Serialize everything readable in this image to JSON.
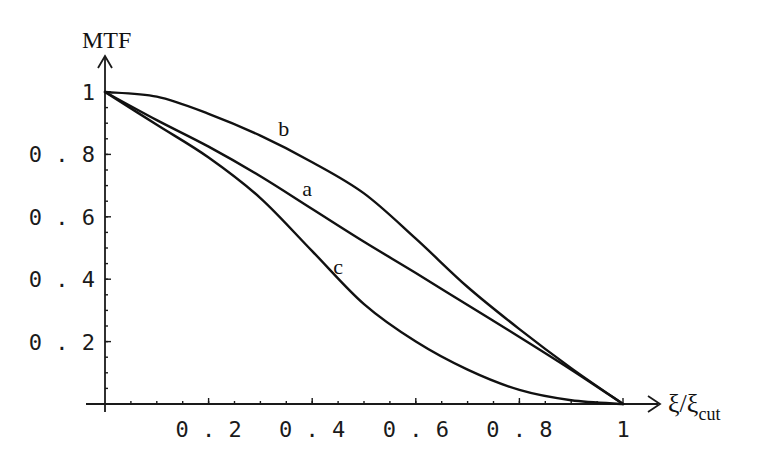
{
  "chart_data": {
    "type": "line",
    "title": "",
    "xlabel": "ξ/ξcut",
    "xlabel_main": "ξ/ξ",
    "xlabel_sub": "cut",
    "ylabel": "MTF",
    "xlim": [
      0,
      1
    ],
    "ylim": [
      0,
      1
    ],
    "grid": false,
    "legend": "inline curve labels",
    "x_ticks": [
      0.2,
      0.4,
      0.6,
      0.8,
      1
    ],
    "x_tick_labels": [
      "0.2",
      "0.4",
      "0.6",
      "0.8",
      "1"
    ],
    "y_ticks": [
      0.2,
      0.4,
      0.6,
      0.8,
      1
    ],
    "y_tick_labels": [
      "0.2",
      "0.4",
      "0.6",
      "0.8",
      "1"
    ],
    "x": [
      0,
      0.1,
      0.2,
      0.3,
      0.4,
      0.5,
      0.6,
      0.7,
      0.8,
      0.9,
      1.0
    ],
    "series": [
      {
        "name": "a",
        "values": [
          1.0,
          0.91,
          0.825,
          0.73,
          0.625,
          0.52,
          0.42,
          0.317,
          0.215,
          0.11,
          0.0
        ],
        "label_pos": [
          0.39,
          0.69
        ]
      },
      {
        "name": "b",
        "values": [
          1.0,
          0.985,
          0.93,
          0.86,
          0.775,
          0.675,
          0.53,
          0.375,
          0.24,
          0.115,
          0.0
        ],
        "label_pos": [
          0.345,
          0.88
        ]
      },
      {
        "name": "c",
        "values": [
          1.0,
          0.895,
          0.79,
          0.66,
          0.49,
          0.32,
          0.2,
          0.11,
          0.045,
          0.012,
          0.0
        ],
        "label_pos": [
          0.45,
          0.44
        ]
      }
    ]
  },
  "plot": {
    "origin_px": [
      105,
      404
    ],
    "x_scale_px": 518,
    "y_scale_px": 312
  }
}
